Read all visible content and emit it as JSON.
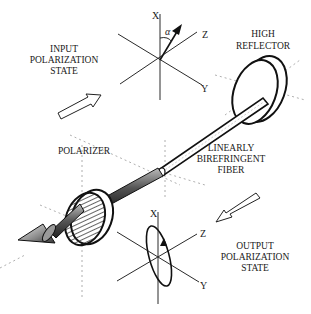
{
  "diagram": {
    "type": "fiber-optic polarization setup illustration",
    "labels": {
      "input_state": [
        "INPUT",
        "POLARIZATION",
        "STATE"
      ],
      "high_reflector": [
        "HIGH",
        "REFLECTOR"
      ],
      "polarizer": "POLARIZER",
      "fiber": [
        "LINEARLY",
        "BIREFRINGENT",
        "FIBER"
      ],
      "output_state": [
        "OUTPUT",
        "POLARIZATION",
        "STATE"
      ]
    },
    "top_axes": {
      "x": "X",
      "y": "Y",
      "z": "Z",
      "angle": "α"
    },
    "bottom_axes": {
      "x": "X",
      "y": "Y",
      "z": "Z"
    },
    "colors": {
      "ink": "#1a1a1a",
      "background": "#ffffff",
      "guide": "#9a9a9a"
    }
  }
}
